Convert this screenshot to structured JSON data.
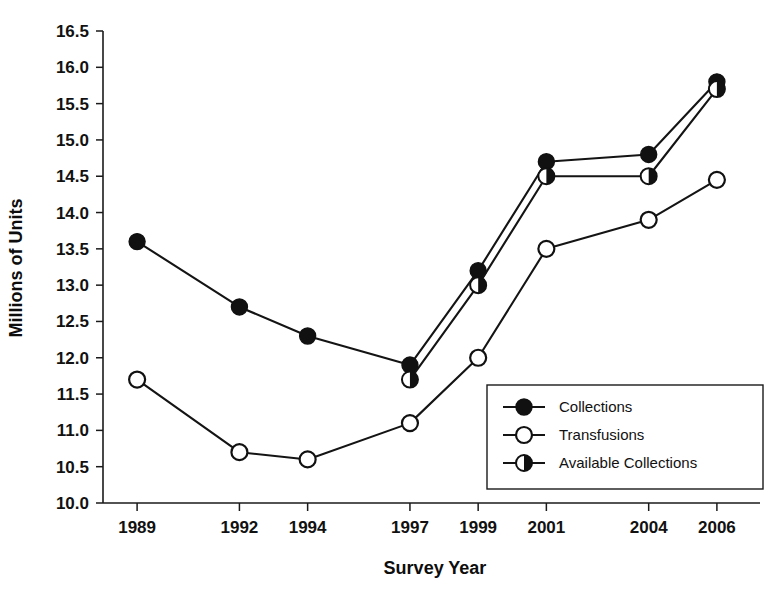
{
  "chart_data": {
    "type": "line",
    "title": "",
    "subtitle": "",
    "xlabel": "Survey Year",
    "ylabel": "Millions of Units",
    "x": [
      1989,
      1992,
      1994,
      1997,
      1999,
      2001,
      2004,
      2006
    ],
    "categories": [
      "1989",
      "1992",
      "1994",
      "1997",
      "1999",
      "2001",
      "2004",
      "2006"
    ],
    "xlim": [
      1988,
      2007
    ],
    "ylim": [
      10.0,
      16.5
    ],
    "yticks": [
      10.0,
      10.5,
      11.0,
      11.5,
      12.0,
      12.5,
      13.0,
      13.5,
      14.0,
      14.5,
      15.0,
      15.5,
      16.0,
      16.5
    ],
    "ytick_labels": [
      "10.0",
      "10.5",
      "11.0",
      "11.5",
      "12.0",
      "12.5",
      "13.0",
      "13.5",
      "14.0",
      "14.5",
      "15.0",
      "15.5",
      "16.0",
      "16.5"
    ],
    "xtick_labels": [
      "1989",
      "1992",
      "1994",
      "1997",
      "1999",
      "2001",
      "2004",
      "2006"
    ],
    "grid": false,
    "legend_position": "lower-right",
    "series": [
      {
        "name": "Collections",
        "marker": "filled-circle",
        "x": [
          1989,
          1992,
          1994,
          1997,
          1999,
          2001,
          2004,
          2006
        ],
        "values": [
          13.6,
          12.7,
          12.3,
          11.9,
          13.2,
          14.7,
          14.8,
          15.8
        ]
      },
      {
        "name": "Transfusions",
        "marker": "open-circle",
        "x": [
          1989,
          1992,
          1994,
          1997,
          1999,
          2001,
          2004,
          2006
        ],
        "values": [
          11.7,
          10.7,
          10.6,
          11.1,
          12.0,
          13.5,
          13.9,
          14.45
        ]
      },
      {
        "name": "Available Collections",
        "marker": "half-filled-circle",
        "x": [
          1997,
          1999,
          2001,
          2004,
          2006
        ],
        "values": [
          11.7,
          13.0,
          14.5,
          14.5,
          15.7
        ]
      }
    ]
  },
  "legend": {
    "entries": [
      {
        "label": "Collections",
        "marker": "filled-circle"
      },
      {
        "label": "Transfusions",
        "marker": "open-circle"
      },
      {
        "label": "Available Collections",
        "marker": "half-filled-circle"
      }
    ]
  },
  "colors": {
    "ink": "#111111",
    "background": "#ffffff",
    "axis": "#1a1a1a"
  }
}
